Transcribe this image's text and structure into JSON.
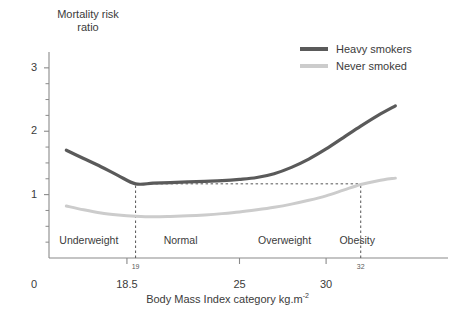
{
  "chart_data": {
    "type": "line",
    "title": "",
    "ylabel": "Mortality risk\nratio",
    "xlabel_main": "Body Mass Index category kg.m",
    "xlabel_exponent": "-2",
    "ylim": [
      0,
      3.25
    ],
    "xlim": [
      14,
      36
    ],
    "yticks_major": [
      0,
      1,
      2,
      3
    ],
    "yticks_major_labels": [
      "0",
      "1",
      "2",
      "3"
    ],
    "yticks_minor": [
      0.25,
      0.5,
      0.75,
      1.25,
      1.5,
      1.75,
      2.25,
      2.5,
      2.75
    ],
    "xticks_major": [
      18.5,
      25,
      30
    ],
    "xticks_major_labels": [
      "18.5",
      "25",
      "30"
    ],
    "xticks_minor_labels": [
      {
        "value": 19,
        "label": "19"
      },
      {
        "value": 32,
        "label": "32"
      }
    ],
    "grid": false,
    "legend_position": "top-right",
    "categories": [
      {
        "label": "Underweight",
        "from": 14,
        "to": 18.5,
        "center": 16.3
      },
      {
        "label": "Normal",
        "from": 18.5,
        "to": 25,
        "center": 21.6
      },
      {
        "label": "Overweight",
        "from": 25,
        "to": 30,
        "center": 27.6
      },
      {
        "label": "Obesity",
        "from": 30,
        "to": 34,
        "center": 31.8
      }
    ],
    "guides": {
      "vertical": [
        {
          "x": 19,
          "from_y": 0,
          "to_y": 1.17
        },
        {
          "x": 32,
          "from_y": 0,
          "to_y": 1.17
        }
      ],
      "horizontal": [
        {
          "y": 1.17,
          "from_x": 19,
          "to_x": 32
        }
      ]
    },
    "series": [
      {
        "name": "Heavy smokers",
        "color": "#5a5a5a",
        "x": [
          15.0,
          16.0,
          17.0,
          18.0,
          19.0,
          20.0,
          21.0,
          22.0,
          23.0,
          24.0,
          25.0,
          26.0,
          27.0,
          28.0,
          29.0,
          30.0,
          31.0,
          32.0,
          33.0,
          34.0
        ],
        "y": [
          1.7,
          1.57,
          1.44,
          1.3,
          1.17,
          1.18,
          1.19,
          1.2,
          1.21,
          1.22,
          1.24,
          1.27,
          1.33,
          1.43,
          1.56,
          1.72,
          1.9,
          2.08,
          2.25,
          2.4
        ]
      },
      {
        "name": "Never smoked",
        "color": "#cccccc",
        "x": [
          15.0,
          16.0,
          17.0,
          18.0,
          19.0,
          20.0,
          21.0,
          22.0,
          23.0,
          24.0,
          25.0,
          26.0,
          27.0,
          28.0,
          29.0,
          30.0,
          31.0,
          32.0,
          33.0,
          34.0
        ],
        "y": [
          0.82,
          0.76,
          0.71,
          0.68,
          0.66,
          0.65,
          0.655,
          0.665,
          0.68,
          0.7,
          0.725,
          0.76,
          0.8,
          0.85,
          0.91,
          0.98,
          1.07,
          1.16,
          1.22,
          1.26
        ]
      }
    ]
  },
  "legend": {
    "items": [
      {
        "label": "Heavy smokers",
        "color": "#5a5a5a"
      },
      {
        "label": "Never smoked",
        "color": "#cccccc"
      }
    ]
  },
  "axes": {
    "axis_color": "#8a8a8a",
    "guide_color": "#555555"
  }
}
